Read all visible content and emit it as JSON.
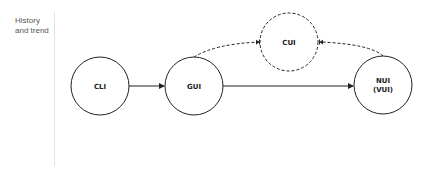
{
  "section": {
    "label_line1": "History",
    "label_line2": "and trend"
  },
  "diagram": {
    "nodes": [
      {
        "id": "cli",
        "label": "CLI",
        "style": "solid"
      },
      {
        "id": "gui",
        "label": "GUI",
        "style": "solid"
      },
      {
        "id": "cui",
        "label": "CUI",
        "style": "dashed"
      },
      {
        "id": "nui",
        "label_line1": "NUI",
        "label_line2": "(VUI)",
        "style": "solid"
      }
    ],
    "edges": [
      {
        "from": "CLI",
        "to": "GUI",
        "style": "solid"
      },
      {
        "from": "GUI",
        "to": "NUI",
        "style": "solid"
      },
      {
        "from": "GUI",
        "to": "CUI",
        "style": "dashed"
      },
      {
        "from": "NUI",
        "to": "CUI",
        "style": "dashed"
      }
    ],
    "colors": {
      "stroke": "#222222",
      "background": "#ffffff"
    }
  }
}
